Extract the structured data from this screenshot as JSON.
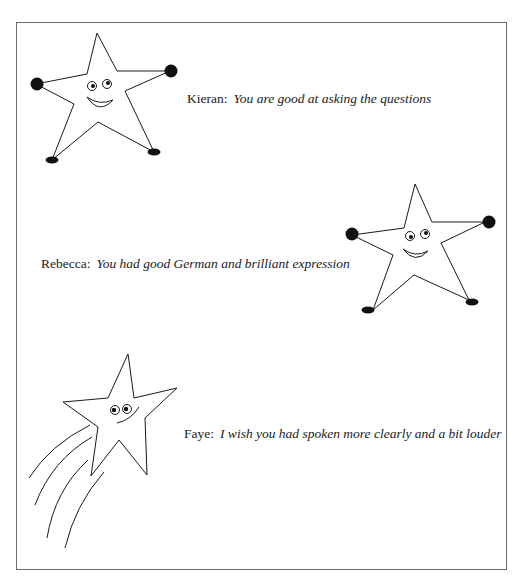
{
  "page": {
    "border_color": "#6a6a6a",
    "ink_color": "#1a1a1a"
  },
  "comments": [
    {
      "name": "Kieran:",
      "quote": "You are good at asking the questions",
      "illustration": "waving-star-icon"
    },
    {
      "name": "Rebecca:",
      "quote": "You had good German and brilliant expression",
      "illustration": "waving-star-icon"
    },
    {
      "name": "Faye:",
      "quote": "I wish you had spoken more clearly and a bit louder",
      "illustration": "shooting-star-icon"
    }
  ]
}
